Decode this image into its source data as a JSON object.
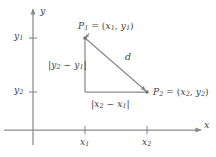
{
  "figure": {
    "background": "#ffffff",
    "line_color": "#8a8a8a",
    "text_color": "#3d3d3d",
    "width": 216,
    "height": 157
  },
  "axes": {
    "x_label": "x",
    "y_label": "y",
    "origin": {
      "x": 33,
      "y": 130
    }
  },
  "ticks": {
    "y": [
      {
        "label_base": "y",
        "label_sub": "1",
        "value": "y₁",
        "pos": 38
      },
      {
        "label_base": "y",
        "label_sub": "2",
        "value": "y₂",
        "pos": 92
      }
    ],
    "x": [
      {
        "label_base": "x",
        "label_sub": "1",
        "value": "x₁",
        "pos": 85
      },
      {
        "label_base": "x",
        "label_sub": "2",
        "value": "x₂",
        "pos": 147
      }
    ]
  },
  "points": {
    "p1": {
      "name": "P",
      "sub": "1",
      "eq": " = (",
      "coord_x": "x",
      "coord_x_sub": "1",
      "comma": ", ",
      "coord_y": "y",
      "coord_y_sub": "1",
      "close": ")",
      "full_text": "P₁ = (x₁, y₁)",
      "x": 85,
      "y": 38
    },
    "p2": {
      "name": "P",
      "sub": "2",
      "eq": " = (",
      "coord_x": "x",
      "coord_x_sub": "2",
      "comma": ", ",
      "coord_y": "y",
      "coord_y_sub": "2",
      "close": ")",
      "full_text": "P₂ = (x₂, y₂)",
      "x": 147,
      "y": 92
    }
  },
  "segments": {
    "hypotenuse": {
      "label": "d",
      "from": "p1",
      "to": "p2"
    },
    "vertical_leg": {
      "open_bar": "|",
      "term1": "y",
      "term1_sub": "2",
      "minus": " − ",
      "term2": "y",
      "term2_sub": "1",
      "close_bar": "|",
      "full_text": "|y₂ − y₁|"
    },
    "horizontal_leg": {
      "open_bar": "|",
      "term1": "x",
      "term1_sub": "2",
      "minus": " − ",
      "term2": "x",
      "term2_sub": "1",
      "close_bar": "|",
      "full_text": "|x₂ − x₁|"
    }
  }
}
